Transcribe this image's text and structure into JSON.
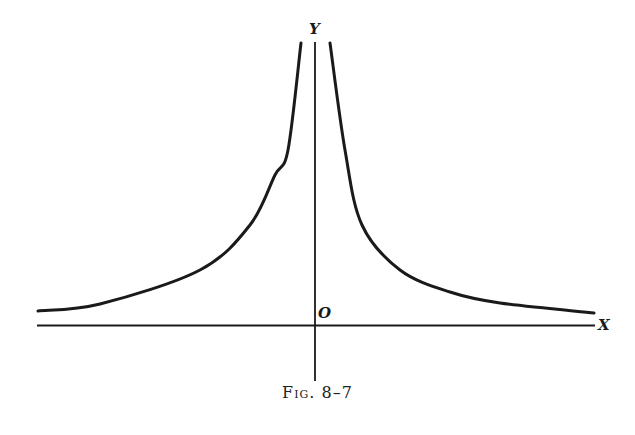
{
  "chart_data": {
    "type": "line",
    "title": "",
    "caption": "Fig. 8–7",
    "xlabel": "X",
    "ylabel": "Y",
    "origin_label": "O",
    "grid": false,
    "legend": null,
    "series": [
      {
        "name": "left branch",
        "points_px": [
          [
            38,
            311
          ],
          [
            100,
            304
          ],
          [
            200,
            270
          ],
          [
            250,
            225
          ],
          [
            275,
            175
          ],
          [
            288,
            150
          ],
          [
            301,
            43
          ]
        ]
      },
      {
        "name": "right branch",
        "points_px": [
          [
            330,
            43
          ],
          [
            345,
            150
          ],
          [
            362,
            225
          ],
          [
            400,
            270
          ],
          [
            450,
            292
          ],
          [
            500,
            303
          ],
          [
            594,
            313
          ]
        ]
      }
    ],
    "axes_px": {
      "origin": [
        315,
        325
      ],
      "x_range": [
        37,
        595
      ],
      "y_range": [
        40,
        380
      ]
    }
  },
  "labels": {
    "x": "X",
    "y": "Y",
    "origin": "O",
    "caption": "Fig. 8–7"
  }
}
